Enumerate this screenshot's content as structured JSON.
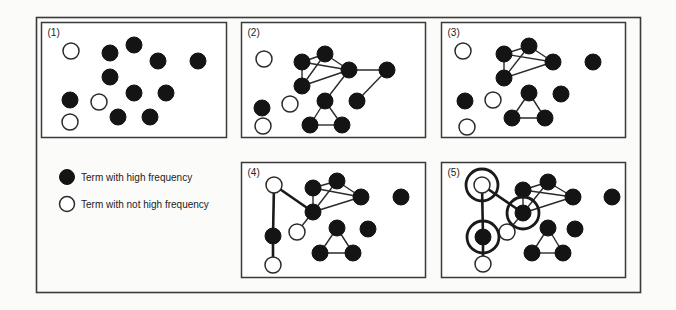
{
  "figure": {
    "legend": [
      {
        "type": "high",
        "label": "Term with high frequency"
      },
      {
        "type": "low",
        "label": "Term with not high frequency"
      }
    ],
    "panels": [
      {
        "label": "(1)",
        "nodes": [
          {
            "id": "o1",
            "type": "low"
          },
          {
            "id": "A",
            "type": "high"
          },
          {
            "id": "B",
            "type": "high"
          },
          {
            "id": "C",
            "type": "high"
          },
          {
            "id": "D",
            "type": "high"
          },
          {
            "id": "E",
            "type": "high"
          },
          {
            "id": "r",
            "type": "high"
          },
          {
            "id": "q",
            "type": "low"
          },
          {
            "id": "F",
            "type": "high"
          },
          {
            "id": "G",
            "type": "high"
          },
          {
            "id": "s",
            "type": "low"
          },
          {
            "id": "H",
            "type": "high"
          },
          {
            "id": "I",
            "type": "high"
          }
        ],
        "edges": [],
        "highlighted": []
      },
      {
        "label": "(2)",
        "nodes": [
          {
            "id": "o1",
            "type": "low"
          },
          {
            "id": "A",
            "type": "high"
          },
          {
            "id": "B",
            "type": "high"
          },
          {
            "id": "C",
            "type": "high"
          },
          {
            "id": "D",
            "type": "high"
          },
          {
            "id": "E",
            "type": "high"
          },
          {
            "id": "F",
            "type": "high"
          },
          {
            "id": "G",
            "type": "high"
          },
          {
            "id": "H",
            "type": "high"
          },
          {
            "id": "I",
            "type": "high"
          },
          {
            "id": "q",
            "type": "low"
          },
          {
            "id": "r",
            "type": "high"
          },
          {
            "id": "s",
            "type": "low"
          }
        ],
        "edges": [
          [
            "A",
            "B"
          ],
          [
            "A",
            "C"
          ],
          [
            "A",
            "E"
          ],
          [
            "B",
            "E"
          ],
          [
            "B",
            "C"
          ],
          [
            "E",
            "C"
          ],
          [
            "C",
            "D"
          ],
          [
            "D",
            "G"
          ],
          [
            "C",
            "F"
          ],
          [
            "F",
            "H"
          ],
          [
            "F",
            "I"
          ],
          [
            "H",
            "I"
          ]
        ],
        "highlighted": []
      },
      {
        "label": "(3)",
        "nodes": [
          {
            "id": "o1",
            "type": "low"
          },
          {
            "id": "A",
            "type": "high"
          },
          {
            "id": "B",
            "type": "high"
          },
          {
            "id": "C",
            "type": "high"
          },
          {
            "id": "D",
            "type": "high"
          },
          {
            "id": "E",
            "type": "high"
          },
          {
            "id": "F",
            "type": "high"
          },
          {
            "id": "G",
            "type": "high"
          },
          {
            "id": "H",
            "type": "high"
          },
          {
            "id": "I",
            "type": "high"
          },
          {
            "id": "r",
            "type": "high"
          },
          {
            "id": "q",
            "type": "low"
          },
          {
            "id": "s",
            "type": "low"
          }
        ],
        "edges": [
          [
            "A",
            "B"
          ],
          [
            "A",
            "C"
          ],
          [
            "A",
            "E"
          ],
          [
            "B",
            "C"
          ],
          [
            "B",
            "E"
          ],
          [
            "E",
            "C"
          ],
          [
            "F",
            "H"
          ],
          [
            "F",
            "I"
          ],
          [
            "H",
            "I"
          ]
        ],
        "highlighted": []
      },
      {
        "label": "(4)",
        "nodes": [
          {
            "id": "P",
            "type": "low"
          },
          {
            "id": "A",
            "type": "high"
          },
          {
            "id": "B",
            "type": "high"
          },
          {
            "id": "C",
            "type": "high"
          },
          {
            "id": "D",
            "type": "high"
          },
          {
            "id": "E",
            "type": "high"
          },
          {
            "id": "Q",
            "type": "low"
          },
          {
            "id": "F",
            "type": "high"
          },
          {
            "id": "G",
            "type": "high"
          },
          {
            "id": "H",
            "type": "high"
          },
          {
            "id": "I",
            "type": "high"
          },
          {
            "id": "R",
            "type": "high"
          },
          {
            "id": "S",
            "type": "low"
          }
        ],
        "edges": [
          [
            "A",
            "B"
          ],
          [
            "A",
            "C"
          ],
          [
            "A",
            "E"
          ],
          [
            "B",
            "C"
          ],
          [
            "B",
            "E"
          ],
          [
            "E",
            "C"
          ],
          [
            "F",
            "H"
          ],
          [
            "F",
            "I"
          ],
          [
            "H",
            "I"
          ],
          [
            "E",
            "Q"
          ]
        ],
        "bold_edges": [
          [
            "P",
            "E"
          ],
          [
            "P",
            "R"
          ],
          [
            "R",
            "S"
          ]
        ],
        "highlighted": []
      },
      {
        "label": "(5)",
        "nodes": [
          {
            "id": "P",
            "type": "low"
          },
          {
            "id": "A",
            "type": "high"
          },
          {
            "id": "B",
            "type": "high"
          },
          {
            "id": "C",
            "type": "high"
          },
          {
            "id": "D",
            "type": "high"
          },
          {
            "id": "E",
            "type": "high"
          },
          {
            "id": "Q",
            "type": "low"
          },
          {
            "id": "F",
            "type": "high"
          },
          {
            "id": "G",
            "type": "high"
          },
          {
            "id": "H",
            "type": "high"
          },
          {
            "id": "I",
            "type": "high"
          },
          {
            "id": "R",
            "type": "high"
          },
          {
            "id": "S",
            "type": "low"
          }
        ],
        "edges": [
          [
            "A",
            "B"
          ],
          [
            "A",
            "C"
          ],
          [
            "A",
            "E"
          ],
          [
            "B",
            "C"
          ],
          [
            "B",
            "E"
          ],
          [
            "E",
            "C"
          ],
          [
            "F",
            "H"
          ],
          [
            "F",
            "I"
          ],
          [
            "H",
            "I"
          ],
          [
            "E",
            "Q"
          ]
        ],
        "bold_edges": [
          [
            "P",
            "E"
          ],
          [
            "P",
            "R"
          ],
          [
            "R",
            "S"
          ]
        ],
        "highlighted": [
          "P",
          "E",
          "R"
        ]
      }
    ]
  }
}
